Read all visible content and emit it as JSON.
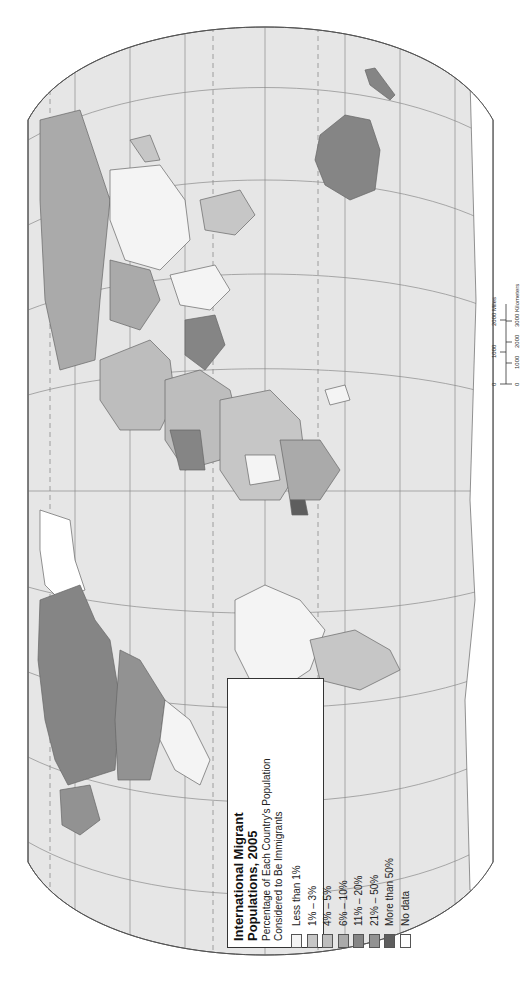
{
  "map": {
    "orientation": "rotated 90° counter-clockwise (north to the left)",
    "projection_outline": "flat-polar elliptical world projection",
    "colors": {
      "ocean": "#e6e6e6",
      "graticule": "#8a8a8a",
      "outline": "#555555",
      "background": "#ffffff"
    }
  },
  "legend": {
    "title_line1": "International Migrant",
    "title_line2": "Populations, 2005",
    "subtitle_line1": "Percentage of Each Country's Population",
    "subtitle_line2": "Considered to Be Immigrants",
    "items": [
      {
        "label": "Less than 1%",
        "color": "#f4f4f4"
      },
      {
        "label": "1% – 3%",
        "color": "#c6c6c6"
      },
      {
        "label": "4% – 5%",
        "color": "#bdbdbd"
      },
      {
        "label": "6% – 10%",
        "color": "#aaaaaa"
      },
      {
        "label": "11% – 20%",
        "color": "#858585"
      },
      {
        "label": "21% – 50%",
        "color": "#929292"
      },
      {
        "label": "More than 50%",
        "color": "#5e5e5e"
      },
      {
        "label": "No data",
        "color": "#ffffff"
      }
    ]
  },
  "scale_bar": {
    "miles_ticks": [
      "0",
      "1000",
      "2000 Miles"
    ],
    "km_ticks": [
      "0",
      "1000",
      "2000",
      "3000 Kilometers"
    ]
  }
}
